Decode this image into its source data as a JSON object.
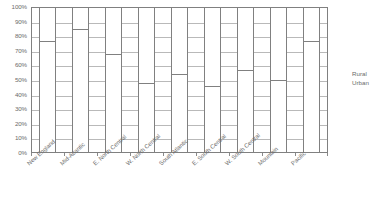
{
  "chart_data": {
    "type": "bar",
    "subtype": "stacked-100-percent",
    "title": "",
    "xlabel": "",
    "ylabel": "",
    "ylim": [
      0,
      100
    ],
    "grid": true,
    "legend_position": "right",
    "categories": [
      "New England",
      "Mid-Atlantic",
      "E. North Central",
      "W. North Central",
      "South Atlantic",
      "E. South Central",
      "W. South Central",
      "Mountain",
      "Pacific"
    ],
    "ytick_labels": [
      "100%",
      "90%",
      "80%",
      "70%",
      "60%",
      "50%",
      "40%",
      "30%",
      "20%",
      "10%",
      "0%"
    ],
    "ytick_values": [
      100,
      90,
      80,
      70,
      60,
      50,
      40,
      30,
      20,
      10,
      0
    ],
    "series": [
      {
        "name": "Urban",
        "values": [
          77,
          85,
          68,
          48,
          54,
          46,
          57,
          50,
          77
        ]
      },
      {
        "name": "Rural",
        "values": [
          23,
          15,
          32,
          52,
          46,
          54,
          43,
          50,
          23
        ]
      }
    ],
    "legend_entries": [
      "Rural",
      "Urban"
    ],
    "colors": {
      "bar_fill": "#ffffff",
      "bar_border": "#808080",
      "gridline": "#b9b9b9",
      "axis": "#808080",
      "text": "#6b6b6b"
    }
  },
  "legend": {
    "rural_label": "Rural",
    "urban_label": "Urban"
  }
}
